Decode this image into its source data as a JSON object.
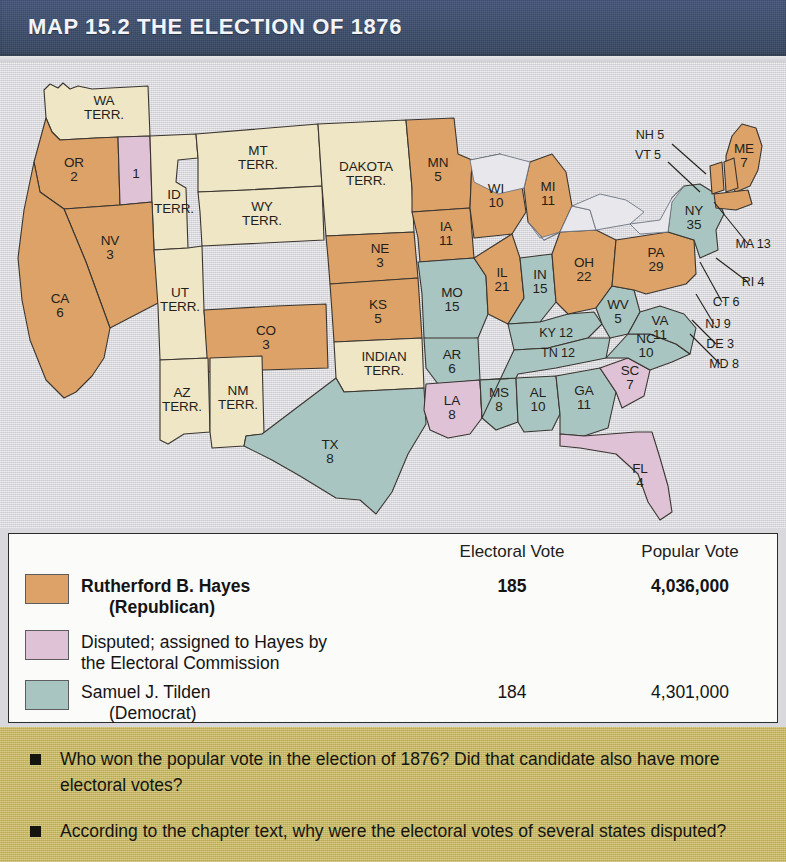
{
  "header": {
    "title": "MAP 15.2  THE ELECTION OF 1876"
  },
  "colors": {
    "hayes": "#dda268",
    "disputed": "#dfc2d6",
    "tilden": "#a9c5c1",
    "territory": "#efe6c6",
    "lake": "#e8e8ec",
    "background": "#d8d8dc",
    "banner": "#3e4f6e",
    "question_band": "#cbbb5e"
  },
  "map": {
    "states": [
      {
        "id": "WA",
        "label": "WA\nTERR.",
        "party": "territory"
      },
      {
        "id": "OR",
        "label": "OR\n2",
        "party": "hayes"
      },
      {
        "id": "ORd",
        "label": "1",
        "party": "disputed"
      },
      {
        "id": "CA",
        "label": "CA\n6",
        "party": "hayes"
      },
      {
        "id": "NV",
        "label": "NV\n3",
        "party": "hayes"
      },
      {
        "id": "ID",
        "label": "ID\nTERR.",
        "party": "territory"
      },
      {
        "id": "MT",
        "label": "MT\nTERR.",
        "party": "territory"
      },
      {
        "id": "WY",
        "label": "WY\nTERR.",
        "party": "territory"
      },
      {
        "id": "UT",
        "label": "UT\nTERR.",
        "party": "territory"
      },
      {
        "id": "AZ",
        "label": "AZ\nTERR.",
        "party": "territory"
      },
      {
        "id": "NM",
        "label": "NM\nTERR.",
        "party": "territory"
      },
      {
        "id": "CO",
        "label": "CO\n3",
        "party": "hayes"
      },
      {
        "id": "DAK",
        "label": "DAKOTA\nTERR.",
        "party": "territory"
      },
      {
        "id": "NE",
        "label": "NE\n3",
        "party": "hayes"
      },
      {
        "id": "KS",
        "label": "KS\n5",
        "party": "hayes"
      },
      {
        "id": "IT",
        "label": "INDIAN\nTERR.",
        "party": "territory"
      },
      {
        "id": "TX",
        "label": "TX\n8",
        "party": "tilden"
      },
      {
        "id": "MN",
        "label": "MN\n5",
        "party": "hayes"
      },
      {
        "id": "IA",
        "label": "IA\n11",
        "party": "hayes"
      },
      {
        "id": "MO",
        "label": "MO\n15",
        "party": "tilden"
      },
      {
        "id": "AR",
        "label": "AR\n6",
        "party": "tilden"
      },
      {
        "id": "LA",
        "label": "LA\n8",
        "party": "disputed"
      },
      {
        "id": "WI",
        "label": "WI\n10",
        "party": "hayes"
      },
      {
        "id": "IL",
        "label": "IL\n21",
        "party": "hayes"
      },
      {
        "id": "MS",
        "label": "MS\n8",
        "party": "tilden"
      },
      {
        "id": "MI",
        "label": "MI\n11",
        "party": "hayes"
      },
      {
        "id": "IN",
        "label": "IN\n15",
        "party": "tilden"
      },
      {
        "id": "KY",
        "label": "KY 12",
        "party": "tilden"
      },
      {
        "id": "TN",
        "label": "TN 12",
        "party": "tilden"
      },
      {
        "id": "AL",
        "label": "AL\n10",
        "party": "tilden"
      },
      {
        "id": "GA",
        "label": "GA\n11",
        "party": "tilden"
      },
      {
        "id": "FL",
        "label": "FL\n4",
        "party": "disputed"
      },
      {
        "id": "OH",
        "label": "OH\n22",
        "party": "hayes"
      },
      {
        "id": "WV",
        "label": "WV\n5",
        "party": "tilden"
      },
      {
        "id": "VA",
        "label": "VA\n11",
        "party": "tilden"
      },
      {
        "id": "NC",
        "label": "NC\n10",
        "party": "tilden"
      },
      {
        "id": "SC",
        "label": "SC\n7",
        "party": "disputed"
      },
      {
        "id": "PA",
        "label": "PA\n29",
        "party": "hayes"
      },
      {
        "id": "NY",
        "label": "NY\n35",
        "party": "tilden"
      },
      {
        "id": "ME",
        "label": "ME\n7",
        "party": "hayes"
      },
      {
        "id": "NH",
        "label": "NH 5",
        "party": "hayes"
      },
      {
        "id": "VT",
        "label": "VT 5",
        "party": "hayes"
      },
      {
        "id": "MA",
        "label": "MA 13",
        "party": "hayes"
      },
      {
        "id": "RI",
        "label": "RI 4",
        "party": "hayes"
      },
      {
        "id": "CT",
        "label": "CT 6",
        "party": "hayes"
      },
      {
        "id": "NJ",
        "label": "NJ 9",
        "party": "tilden"
      },
      {
        "id": "DE",
        "label": "DE 3",
        "party": "tilden"
      },
      {
        "id": "MD",
        "label": "MD 8",
        "party": "tilden"
      }
    ]
  },
  "legend": {
    "col_electoral": "Electoral Vote",
    "col_popular": "Popular Vote",
    "rows": [
      {
        "swatch": "hayes",
        "name": "Rutherford B. Hayes",
        "name_sub": "(Republican)",
        "electoral": "185",
        "popular": "4,036,000",
        "bold": true
      },
      {
        "swatch": "disputed",
        "name": "Disputed; assigned to Hayes by",
        "name_sub": "the Electoral Commission",
        "electoral": "",
        "popular": "",
        "bold": false
      },
      {
        "swatch": "tilden",
        "name": "Samuel J. Tilden",
        "name_sub": "(Democrat)",
        "electoral": "184",
        "popular": "4,301,000",
        "bold": false
      }
    ]
  },
  "questions": [
    "Who won the popular vote in the election of 1876? Did that candidate also have more electoral votes?",
    "According to the chapter text, why were the electoral votes of several states disputed?"
  ]
}
